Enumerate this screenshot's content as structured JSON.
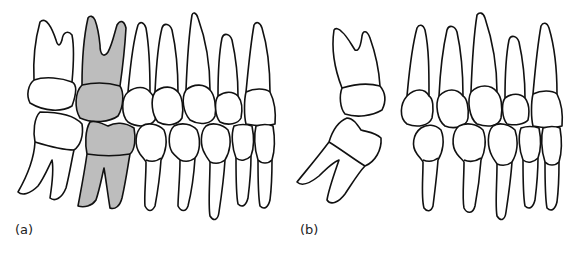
{
  "figure": {
    "panels": [
      {
        "id": "a",
        "label": "(a)",
        "description": "Upper and lower dentition in occlusion with one upper and one lower molar shaded grey"
      },
      {
        "id": "b",
        "label": "(b)",
        "description": "Same dentition with the molar pair removed and the posterior molars tipped toward the gap"
      }
    ],
    "colors": {
      "outline": "#111111",
      "tooth_fill": "#ffffff",
      "highlight_fill": "#bdbdbd",
      "background": "#ffffff"
    }
  }
}
